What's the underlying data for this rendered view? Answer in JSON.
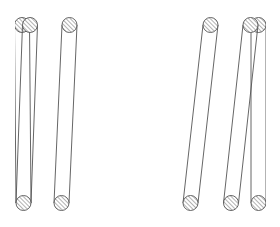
{
  "diagram": {
    "type": "coil-winding-cross-section",
    "stroke_color": "#555555",
    "background": "#ffffff",
    "hatch_color": "#666666",
    "wire_radius": 7.5,
    "top_y": 25,
    "bottom_y": 203,
    "wires": [
      {
        "id": "left-partial",
        "top_cx": 22,
        "bottom_cx": 23.5,
        "clip_left": 15,
        "partial_top": true
      },
      {
        "id": "left-a",
        "top_cx": 30,
        "bottom_cx": 23.5
      },
      {
        "id": "left-b",
        "top_cx": 69.5,
        "bottom_cx": 61.5
      },
      {
        "id": "right-a",
        "top_cx": 210.5,
        "bottom_cx": 190.5
      },
      {
        "id": "right-b",
        "top_cx": 250.5,
        "bottom_cx": 231
      },
      {
        "id": "right-partial",
        "top_cx": 258.5,
        "bottom_cx": 258.5,
        "clip_right": 266,
        "partial_top": true
      }
    ]
  }
}
